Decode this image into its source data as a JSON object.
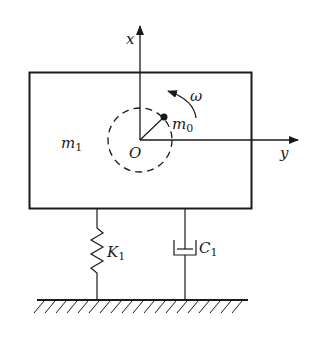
{
  "diagram": {
    "type": "mechanical-vibration-model",
    "colors": {
      "stroke": "#1a1a1a",
      "background": "#ffffff"
    },
    "labels": {
      "x_axis": "x",
      "y_axis": "y",
      "origin": "O",
      "omega": "ω",
      "m1_base": "m",
      "m1_sub": "1",
      "m0_base": "m",
      "m0_sub": "0",
      "k1_base": "K",
      "k1_sub": "1",
      "c1_base": "C",
      "c1_sub": "1"
    },
    "elements": {
      "main_mass": {
        "label": "m1",
        "x": 29,
        "y": 72,
        "width": 223,
        "height": 137
      },
      "origin": {
        "x": 140,
        "y": 140
      },
      "eccentric_circle_radius": 32,
      "eccentric_mass": {
        "label": "m0",
        "x": 164,
        "y": 117
      },
      "spring": {
        "label": "K1",
        "x": 97
      },
      "damper": {
        "label": "C1",
        "x": 185
      },
      "ground_y": 300
    }
  }
}
